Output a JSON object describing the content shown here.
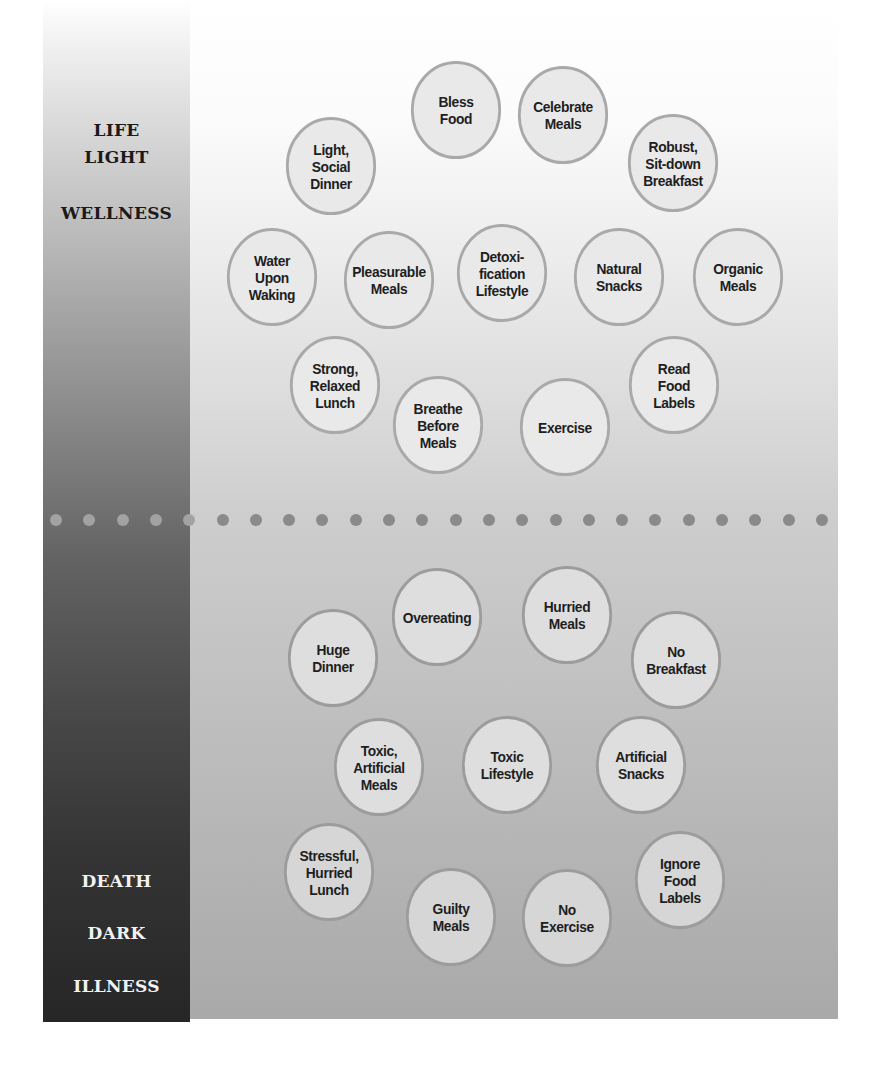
{
  "diagram": {
    "left_bar": {
      "top_labels": [
        "LIFE",
        "LIGHT",
        "WELLNESS"
      ],
      "bottom_labels": [
        "DEATH",
        "DARK",
        "ILLNESS"
      ]
    },
    "positive_habits": [
      {
        "label": "Bless\nFood",
        "x": 456,
        "y": 110
      },
      {
        "label": "Celebrate\nMeals",
        "x": 563,
        "y": 115
      },
      {
        "label": "Light,\nSocial\nDinner",
        "x": 331,
        "y": 166
      },
      {
        "label": "Robust,\nSit-down\nBreakfast",
        "x": 673,
        "y": 163
      },
      {
        "label": "Water\nUpon\nWaking",
        "x": 272,
        "y": 277
      },
      {
        "label": "Pleasurable\nMeals",
        "x": 389,
        "y": 280
      },
      {
        "label": "Detoxi-\nfication\nLifestyle",
        "x": 502,
        "y": 273
      },
      {
        "label": "Natural\nSnacks",
        "x": 619,
        "y": 277
      },
      {
        "label": "Organic\nMeals",
        "x": 738,
        "y": 277
      },
      {
        "label": "Strong,\nRelaxed\nLunch",
        "x": 335,
        "y": 385
      },
      {
        "label": "Breathe\nBefore\nMeals",
        "x": 438,
        "y": 425
      },
      {
        "label": "Exercise",
        "x": 565,
        "y": 427
      },
      {
        "label": "Read\nFood\nLabels",
        "x": 674,
        "y": 385
      }
    ],
    "negative_habits": [
      {
        "label": "Overeating",
        "x": 437,
        "y": 617
      },
      {
        "label": "Hurried\nMeals",
        "x": 567,
        "y": 615
      },
      {
        "label": "Huge\nDinner",
        "x": 333,
        "y": 658
      },
      {
        "label": "No\nBreakfast",
        "x": 676,
        "y": 660
      },
      {
        "label": "Toxic,\nArtificial\nMeals",
        "x": 379,
        "y": 767
      },
      {
        "label": "Toxic\nLifestyle",
        "x": 507,
        "y": 765
      },
      {
        "label": "Artificial\nSnacks",
        "x": 641,
        "y": 765
      },
      {
        "label": "Stressful,\nHurried\nLunch",
        "x": 329,
        "y": 872
      },
      {
        "label": "Guilty\nMeals",
        "x": 451,
        "y": 917
      },
      {
        "label": "No\nExercise",
        "x": 567,
        "y": 918
      },
      {
        "label": "Ignore\nFood\nLabels",
        "x": 680,
        "y": 880
      }
    ],
    "divider": {
      "y": 520,
      "start_x": 56,
      "spacing": 33.3,
      "count": 24
    },
    "colors": {
      "bubble_border": "#a9a9a9",
      "dot_on_dark": "#a2a2a2",
      "dot_on_light": "#8a8a8a",
      "bar_bottom": "#262626",
      "panel_bottom": "#a9a9a9"
    }
  }
}
